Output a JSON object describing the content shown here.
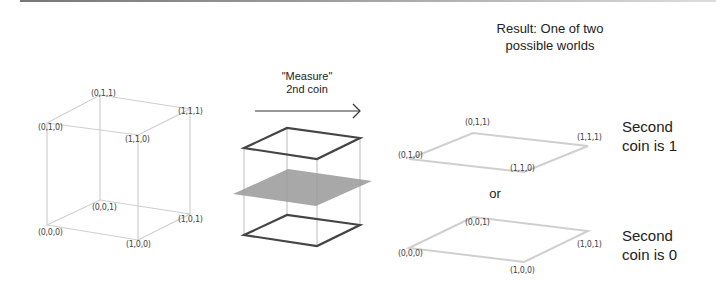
{
  "cube": {
    "labels": {
      "v010": "(0,1,0)",
      "v011": "(0,1,1)",
      "v111": "(1,1,1)",
      "v110": "(1,1,0)",
      "v000": "(0,0,0)",
      "v001": "(0,0,1)",
      "v101": "(1,0,1)",
      "v100": "(1,0,0)"
    },
    "edge_color": "#cccccc"
  },
  "measure": {
    "line1": "\"Measure\"",
    "line2": "2nd coin",
    "plane_color": "#999999",
    "edge_color": "#444444"
  },
  "result": {
    "title_line1": "Result: One of two",
    "title_line2": "possible worlds",
    "or_label": "or",
    "world1": {
      "labels": {
        "a": "(0,1,1)",
        "b": "(1,1,1)",
        "c": "(0,1,0)",
        "d": "(1,1,0)"
      },
      "caption_line1": "Second",
      "caption_line2": "coin is 1"
    },
    "world0": {
      "labels": {
        "a": "(0,0,1)",
        "b": "(1,0,1)",
        "c": "(0,0,0)",
        "d": "(1,0,0)"
      },
      "caption_line1": "Second",
      "caption_line2": "coin is 0"
    }
  }
}
